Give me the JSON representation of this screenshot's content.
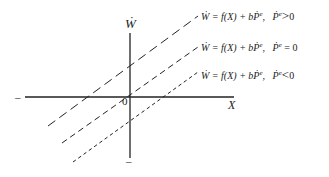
{
  "figure": {
    "axes": {
      "y_label": "Ẇ",
      "x_label": "X",
      "origin_label": "0",
      "x_negative_mark": "–",
      "y_negative_mark": "–"
    },
    "lines": [
      {
        "style": "long-dash",
        "equation": "Ẇ = f(X) + bṖ",
        "superscript": "e",
        "condition_var": "Ṗ",
        "condition_sup": "e",
        "condition_op": ">",
        "condition_val": "0"
      },
      {
        "style": "medium-dash",
        "equation": "Ẇ = f(X) + bṖ",
        "superscript": "e",
        "condition_var": "Ṗ",
        "condition_sup": "e",
        "condition_op": "=",
        "condition_val": "0"
      },
      {
        "style": "short-dash",
        "equation": "Ẇ = f(X) + bṖ",
        "superscript": "e",
        "condition_var": "Ṗ",
        "condition_sup": "e",
        "condition_op": "<",
        "condition_val": "0"
      }
    ],
    "colors": {
      "ink": "#222222",
      "background": "#ffffff"
    }
  }
}
